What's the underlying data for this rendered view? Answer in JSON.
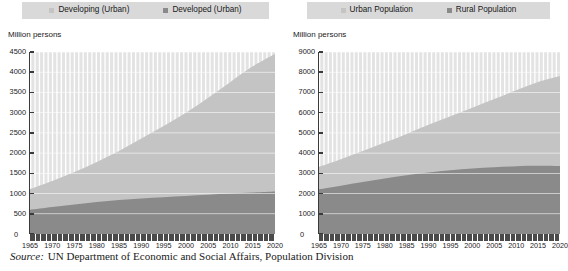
{
  "source": {
    "prefix": "Source:",
    "text": "UN Department of Economic and Social Affairs, Population Division"
  },
  "colors": {
    "light_series": "#c4c4c4",
    "dark_series": "#8a8a8a",
    "legend_background": "#d9d9d9",
    "axis": "#3a3a3a",
    "gridline": "#ffffff",
    "plot_background": "#e3e3e3"
  },
  "charts": [
    {
      "id": "urban-population-by-development-group",
      "axis_title": "Million persons",
      "legend": [
        {
          "label": "Developing (Urban)",
          "swatch": "#c4c4c4"
        },
        {
          "label": "Developed (Urban)",
          "swatch": "#8a8a8a"
        }
      ],
      "chart_data": {
        "type": "area",
        "stacked": true,
        "title": "",
        "subtitle": "",
        "xlabel": "",
        "ylabel": "Million persons",
        "xlim": [
          1965,
          2020
        ],
        "ylim": [
          0,
          4500
        ],
        "ytick_step": 500,
        "xtick_step": 5,
        "grid": true,
        "legend_position": "top",
        "x": [
          1965,
          1970,
          1975,
          1980,
          1985,
          1990,
          1995,
          2000,
          2005,
          2010,
          2015,
          2020
        ],
        "xtick_labels": [
          "1965",
          "1970",
          "1975",
          "1980",
          "1985",
          "1990",
          "1995",
          "2000",
          "2005",
          "2010",
          "2015",
          "2020"
        ],
        "ytick_labels": [
          "0",
          "500",
          "1000",
          "1500",
          "2000",
          "2500",
          "3000",
          "3500",
          "4000",
          "4500"
        ],
        "series": [
          {
            "name": "Developed (Urban)",
            "color": "#8a8a8a",
            "values": [
              600,
              670,
              730,
              790,
              840,
              880,
              910,
              940,
              970,
              1000,
              1025,
              1050
            ]
          },
          {
            "name": "Developing (Urban)",
            "color": "#c4c4c4",
            "values": [
              510,
              640,
              800,
              990,
              1210,
              1480,
              1760,
              2060,
              2400,
              2760,
              3120,
              3400
            ]
          }
        ],
        "totals": [
          1110,
          1310,
          1530,
          1780,
          2050,
          2360,
          2670,
          3000,
          3370,
          3760,
          4145,
          4450
        ]
      }
    },
    {
      "id": "urban-and-rural-population",
      "axis_title": "Million persons",
      "legend": [
        {
          "label": "Urban Population",
          "swatch": "#c4c4c4"
        },
        {
          "label": "Rural Population",
          "swatch": "#8a8a8a"
        }
      ],
      "chart_data": {
        "type": "area",
        "stacked": true,
        "title": "",
        "subtitle": "",
        "xlabel": "",
        "ylabel": "Million persons",
        "xlim": [
          1965,
          2020
        ],
        "ylim": [
          0,
          9000
        ],
        "ytick_step": 1000,
        "xtick_step": 5,
        "grid": true,
        "legend_position": "top",
        "x": [
          1965,
          1970,
          1975,
          1980,
          1985,
          1990,
          1995,
          2000,
          2005,
          2010,
          2015,
          2020
        ],
        "xtick_labels": [
          "1965",
          "1970",
          "1975",
          "1980",
          "1985",
          "1990",
          "1995",
          "2000",
          "2005",
          "2010",
          "2015",
          "2020"
        ],
        "ytick_labels": [
          "0",
          "1000",
          "2000",
          "3000",
          "4000",
          "5000",
          "6000",
          "7000",
          "8000",
          "9000"
        ],
        "series": [
          {
            "name": "Rural Population",
            "color": "#8a8a8a",
            "values": [
              2210,
              2390,
              2570,
              2740,
              2900,
              3040,
              3150,
              3240,
              3300,
              3350,
              3370,
              3360
            ]
          },
          {
            "name": "Urban Population",
            "color": "#c4c4c4",
            "values": [
              1110,
              1310,
              1530,
              1780,
              2050,
              2360,
              2670,
              3000,
              3370,
              3760,
              4145,
              4450
            ]
          }
        ],
        "totals": [
          3320,
          3700,
          4100,
          4520,
          4950,
          5400,
          5820,
          6240,
          6670,
          7110,
          7515,
          7810
        ]
      }
    }
  ]
}
